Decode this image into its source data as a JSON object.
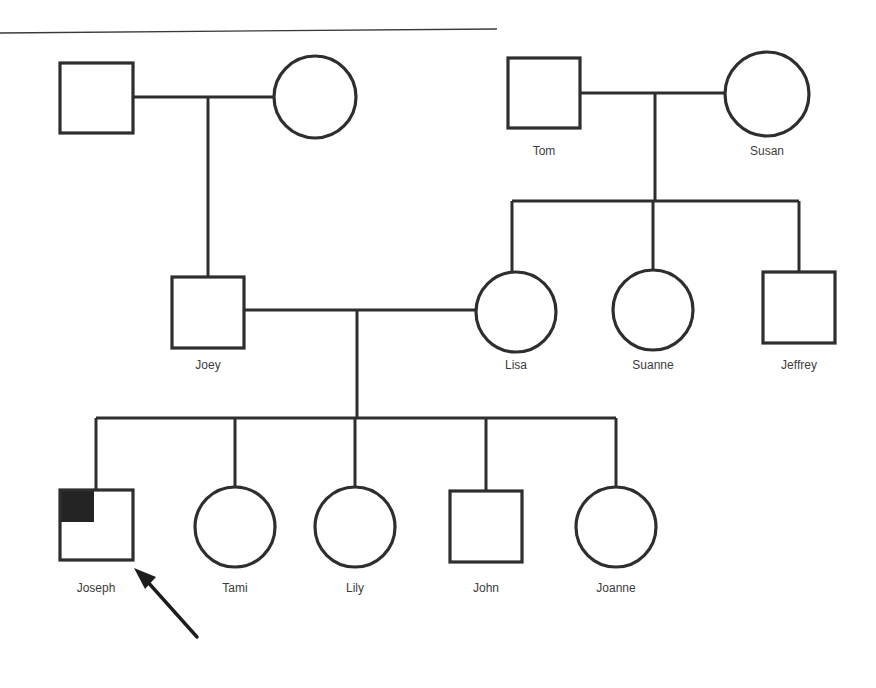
{
  "diagram": {
    "type": "pedigree-genogram",
    "title": "",
    "colors": {
      "stroke": "#2e2e2e",
      "affected_fill": "#232323",
      "label_text": "#3c3c3c",
      "background": "#ffffff",
      "rule": "#3a3a3a"
    },
    "legend_notes": {
      "square_meaning": "male",
      "circle_meaning": "female",
      "filled_quadrant_meaning": "affected",
      "arrow_meaning": "proband"
    },
    "top_rule": {
      "x1": 0,
      "y1": 33,
      "x2": 497,
      "y2": 29
    },
    "generations": [
      {
        "name": "generation-1",
        "people": [
          {
            "id": "g1-father-left",
            "label": "",
            "sex": "male",
            "shape": "square",
            "affected": false,
            "x": 60,
            "y": 63,
            "w": 73,
            "h": 70
          },
          {
            "id": "g1-mother-left",
            "label": "",
            "sex": "female",
            "shape": "circle",
            "affected": false,
            "cx": 315,
            "cy": 97,
            "r": 41
          },
          {
            "id": "g1-tom",
            "label": "Tom",
            "sex": "male",
            "shape": "square",
            "affected": false,
            "x": 508,
            "y": 58,
            "w": 72,
            "h": 70,
            "label_x": 544,
            "label_y": 152
          },
          {
            "id": "g1-susan",
            "label": "Susan",
            "sex": "female",
            "shape": "circle",
            "affected": false,
            "cx": 767,
            "cy": 94,
            "r": 42,
            "label_x": 767,
            "label_y": 152
          }
        ]
      },
      {
        "name": "generation-2",
        "people": [
          {
            "id": "g2-joey",
            "label": "Joey",
            "sex": "male",
            "shape": "square",
            "affected": false,
            "x": 172,
            "y": 277,
            "w": 72,
            "h": 71,
            "label_x": 208,
            "label_y": 366
          },
          {
            "id": "g2-lisa",
            "label": "Lisa",
            "sex": "female",
            "shape": "circle",
            "affected": false,
            "cx": 516,
            "cy": 312,
            "r": 40,
            "label_x": 516,
            "label_y": 366
          },
          {
            "id": "g2-suanne",
            "label": "Suanne",
            "sex": "female",
            "shape": "circle",
            "affected": false,
            "cx": 653,
            "cy": 310,
            "r": 40,
            "label_x": 653,
            "label_y": 366
          },
          {
            "id": "g2-jeffrey",
            "label": "Jeffrey",
            "sex": "male",
            "shape": "square",
            "affected": false,
            "x": 763,
            "y": 272,
            "w": 72,
            "h": 71,
            "label_x": 799,
            "label_y": 366
          }
        ]
      },
      {
        "name": "generation-3",
        "people": [
          {
            "id": "g3-joseph",
            "label": "Joseph",
            "sex": "male",
            "shape": "square",
            "affected": true,
            "proband": true,
            "x": 60,
            "y": 490,
            "w": 73,
            "h": 70,
            "label_x": 96,
            "label_y": 589
          },
          {
            "id": "g3-tami",
            "label": "Tami",
            "sex": "female",
            "shape": "circle",
            "affected": false,
            "cx": 235,
            "cy": 527,
            "r": 40,
            "label_x": 235,
            "label_y": 589
          },
          {
            "id": "g3-lily",
            "label": "Lily",
            "sex": "female",
            "shape": "circle",
            "affected": false,
            "cx": 355,
            "cy": 527,
            "r": 40,
            "label_x": 355,
            "label_y": 589
          },
          {
            "id": "g3-john",
            "label": "John",
            "sex": "male",
            "shape": "square",
            "affected": false,
            "x": 450,
            "y": 491,
            "w": 72,
            "h": 71,
            "label_x": 486,
            "label_y": 589
          },
          {
            "id": "g3-joanne",
            "label": "Joanne",
            "sex": "female",
            "shape": "circle",
            "affected": false,
            "cx": 616,
            "cy": 527,
            "r": 40,
            "label_x": 616,
            "label_y": 589
          }
        ]
      }
    ],
    "unions": [
      {
        "id": "union-g1-left",
        "partners": [
          "g1-father-left",
          "g1-mother-left"
        ],
        "line": {
          "x1": 133,
          "y1": 97,
          "x2": 274,
          "y2": 97
        },
        "descent": {
          "x": 208,
          "y1": 97,
          "y2": 277
        }
      },
      {
        "id": "union-tom-susan",
        "partners": [
          "g1-tom",
          "g1-susan"
        ],
        "line": {
          "x1": 580,
          "y1": 93,
          "x2": 725,
          "y2": 93
        },
        "descent": {
          "x": 655,
          "y1": 93,
          "y2": 201
        }
      },
      {
        "id": "union-joey-lisa",
        "partners": [
          "g2-joey",
          "g2-lisa"
        ],
        "line": {
          "x1": 244,
          "y1": 310,
          "x2": 476,
          "y2": 310
        },
        "descent": {
          "x": 357,
          "y1": 310,
          "y2": 418
        }
      }
    ],
    "sibships": [
      {
        "id": "sibship-tom-susan-children",
        "bar": {
          "x1": 512,
          "y": 201,
          "x2": 799
        },
        "drops": [
          {
            "child": "g2-lisa",
            "x": 512,
            "y1": 201,
            "y2": 272
          },
          {
            "child": "g2-suanne",
            "x": 653,
            "y1": 201,
            "y2": 270
          },
          {
            "child": "g2-jeffrey",
            "x": 799,
            "y1": 201,
            "y2": 272
          }
        ]
      },
      {
        "id": "sibship-joey-lisa-children",
        "bar": {
          "x1": 96,
          "y": 418,
          "x2": 616
        },
        "drops": [
          {
            "child": "g3-joseph",
            "x": 96,
            "y1": 418,
            "y2": 490
          },
          {
            "child": "g3-tami",
            "x": 235,
            "y1": 418,
            "y2": 487
          },
          {
            "child": "g3-lily",
            "x": 355,
            "y1": 418,
            "y2": 487
          },
          {
            "child": "g3-john",
            "x": 486,
            "y1": 418,
            "y2": 491
          },
          {
            "child": "g3-joanne",
            "x": 616,
            "y1": 418,
            "y2": 487
          }
        ]
      }
    ],
    "proband_arrow": {
      "target": "g3-joseph",
      "tail_x": 197,
      "tail_y": 637,
      "tip_x": 137,
      "tip_y": 571
    }
  }
}
